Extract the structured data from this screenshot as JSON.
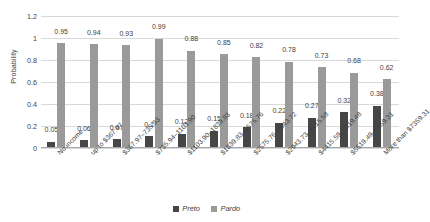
{
  "chart_data": {
    "type": "bar",
    "title": "",
    "xlabel": "",
    "ylabel": "Probability",
    "ylim": [
      0,
      1.2
    ],
    "yticks": [
      "0",
      "0.2",
      "0.4",
      "0.6",
      "0.8",
      "1",
      "1.2"
    ],
    "grid": true,
    "legend_position": "bottom",
    "categories": [
      "No income",
      "up to $367.97",
      "$367.97–735.93",
      "$735.94–1103.90",
      "$1103.90–1839.83",
      "$1839.83–2575.76",
      "$2575.76–2943.72",
      "$2943.73–4415.58",
      "$4415.59–5519.48",
      "$5519.49–7359.31",
      "More than $7359.31"
    ],
    "series": [
      {
        "name": "Preto",
        "color": "#464646",
        "values": [
          0.05,
          0.06,
          0.07,
          0.1,
          0.12,
          0.15,
          0.18,
          0.22,
          0.27,
          0.32,
          0.38
        ],
        "labels": [
          "0.05",
          "0.06",
          "0.07",
          "0.1",
          "0.12",
          "0.15",
          "0.18",
          "0.22",
          "0.27",
          "0.32",
          "0.38"
        ]
      },
      {
        "name": "Pardo",
        "color": "#9a9a9a",
        "values": [
          0.95,
          0.94,
          0.93,
          0.99,
          0.88,
          0.85,
          0.82,
          0.78,
          0.73,
          0.68,
          0.62
        ],
        "labels": [
          "0.95",
          "0.94",
          "0.93",
          "0.99",
          "0.88",
          "0.85",
          "0.82",
          "0.78",
          "0.73",
          "0.68",
          "0.62"
        ]
      }
    ]
  },
  "legend": {
    "preto_label": "Preto",
    "pardo_label": "Pardo"
  }
}
